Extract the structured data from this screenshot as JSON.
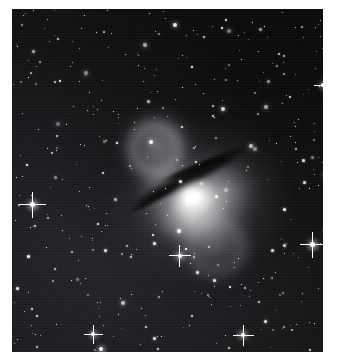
{
  "image": {
    "kind": "astronomical-photograph",
    "subject": "Centaurus A (NGC 5128) peculiar elliptical galaxy",
    "palette": "grayscale",
    "description": "Grayscale deep-sky exposure of a bright elliptical galaxy bisected by a dark dust lane, surrounded by a dense field of foreground stars",
    "alt_text": "Bright galaxy core crossed by a dark dust lane, with a faint arc above-left and a diffuse lobe below-right, set in a dense star field",
    "canvas": {
      "width": 339,
      "height": 362,
      "background": "#ffffff"
    },
    "plate": {
      "left": 12,
      "top": 9,
      "width": 311,
      "height": 343,
      "background": "#101012"
    },
    "colors": {
      "sky_dark": "#0c0c0e",
      "sky_mid": "#1a1b1e",
      "sky_light": "#232327",
      "galaxy_halo": "#8e8e92",
      "galaxy_core": "#f2f2f0",
      "dust_lane": "#14141a",
      "star": "#ffffff",
      "margin": "#ffffff"
    },
    "features": [
      {
        "name": "galaxy-core",
        "label": "bright nucleus",
        "cx": 178,
        "cy": 186
      },
      {
        "name": "dust-lane",
        "label": "dark dust lane",
        "angle_deg": -27
      },
      {
        "name": "northern-shell",
        "label": "northern arc / shell",
        "cx": 137,
        "cy": 130
      },
      {
        "name": "southern-lobe",
        "label": "southern diffuse lobe",
        "cx": 198,
        "cy": 232
      }
    ],
    "bright_stars": [
      {
        "x": 26,
        "y": 200,
        "size": 5,
        "spikes": true
      },
      {
        "x": 301,
        "y": 236,
        "size": 5,
        "spikes": true
      },
      {
        "x": 168,
        "y": 247,
        "size": 4,
        "spikes": true
      },
      {
        "x": 231,
        "y": 326,
        "size": 4,
        "spikes": true
      },
      {
        "x": 81,
        "y": 325,
        "size": 3,
        "spikes": true
      },
      {
        "x": 311,
        "y": 76,
        "size": 4,
        "spikes": true
      },
      {
        "x": 89,
        "y": 340,
        "size": 3,
        "spikes": false
      }
    ],
    "star_count_estimate": 420
  }
}
